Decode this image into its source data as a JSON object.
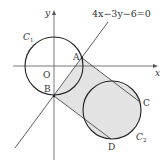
{
  "diagram": {
    "equation_label": "4x−3y−6=0",
    "axes": {
      "x_label": "x",
      "y_label": "y",
      "origin_label": "O"
    },
    "circles": [
      {
        "name": "C1",
        "label_main": "C",
        "label_sub": "1",
        "center_px": [
          54,
          66
        ],
        "radius_px": 29
      },
      {
        "name": "C2",
        "label_main": "C",
        "label_sub": "2",
        "center_px": [
          112,
          110
        ],
        "radius_px": 29
      }
    ],
    "points": [
      {
        "name": "A",
        "label": "A",
        "px": [
          82,
          58
        ]
      },
      {
        "name": "B",
        "label": "B",
        "px": [
          54,
          96
        ]
      },
      {
        "name": "C",
        "label": "C",
        "px": [
          140,
          102
        ]
      },
      {
        "name": "D",
        "label": "D",
        "px": [
          111,
          139
        ]
      }
    ],
    "shaded_region_color": "#e3e3e3",
    "stroke_color": "#333333"
  }
}
